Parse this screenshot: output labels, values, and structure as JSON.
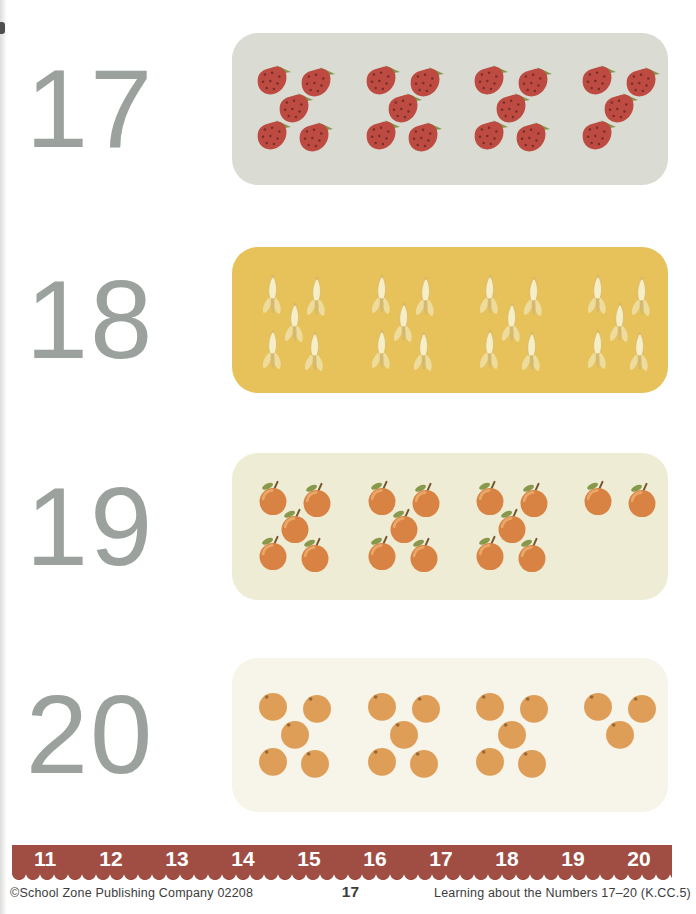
{
  "page": {
    "kind": "counting worksheet",
    "background": "#ffffff",
    "numeral_color": "#9ba19c",
    "footer_text_color": "#3c3c3c"
  },
  "rows": [
    {
      "numeral": "17",
      "fruit": "strawberry",
      "fruit_plural": "strawberries",
      "groups": [
        5,
        5,
        5,
        4
      ],
      "total_objects": 19,
      "panel_color": "#dadcd3"
    },
    {
      "numeral": "18",
      "fruit": "banana",
      "fruit_plural": "bananas",
      "groups": [
        5,
        5,
        5,
        5
      ],
      "total_objects": 20,
      "panel_color": "#e7c159"
    },
    {
      "numeral": "19",
      "fruit": "apple",
      "fruit_plural": "apples",
      "groups": [
        5,
        5,
        5,
        2
      ],
      "total_objects": 17,
      "panel_color": "#eeecd4"
    },
    {
      "numeral": "20",
      "fruit": "orange",
      "fruit_plural": "oranges",
      "groups": [
        5,
        5,
        5,
        3
      ],
      "total_objects": 18,
      "panel_color": "#f7f4e9"
    }
  ],
  "fruit_colors": {
    "strawberry": {
      "body": "#bd4b41",
      "seed": "#7a2e28",
      "leaf": "#84974b"
    },
    "banana": {
      "flesh": "#f6eec6",
      "peel": "#eedc9c",
      "shade": "#d4b96e"
    },
    "apple": {
      "body": "#d88244",
      "highlight": "#eaa868",
      "leaf": "#88994c",
      "stem": "#77552f"
    },
    "orange": {
      "body": "#de9e58",
      "dot": "#9a6631"
    }
  },
  "number_line": {
    "values": [
      "11",
      "12",
      "13",
      "14",
      "15",
      "16",
      "17",
      "18",
      "19",
      "20"
    ],
    "bar_color": "#a04e44",
    "text_color": "#ffffff"
  },
  "footer": {
    "left": "©School Zone Publishing Company  02208",
    "page_number": "17",
    "right": "Learning about the Numbers 17–20  (K.CC.5)"
  }
}
